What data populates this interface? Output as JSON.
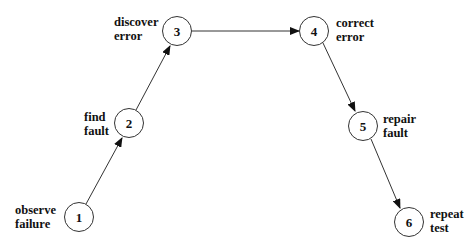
{
  "diagram": {
    "type": "process-flow",
    "nodes": [
      {
        "id": "1",
        "number": "1",
        "label_line1": "observe",
        "label_line2": "failure"
      },
      {
        "id": "2",
        "number": "2",
        "label_line1": "find",
        "label_line2": "fault"
      },
      {
        "id": "3",
        "number": "3",
        "label_line1": "discover",
        "label_line2": "error"
      },
      {
        "id": "4",
        "number": "4",
        "label_line1": "correct",
        "label_line2": "error"
      },
      {
        "id": "5",
        "number": "5",
        "label_line1": "repair",
        "label_line2": "fault"
      },
      {
        "id": "6",
        "number": "6",
        "label_line1": "repeat",
        "label_line2": "test"
      }
    ],
    "edges": [
      {
        "from": "1",
        "to": "2"
      },
      {
        "from": "2",
        "to": "3"
      },
      {
        "from": "3",
        "to": "4"
      },
      {
        "from": "4",
        "to": "5"
      },
      {
        "from": "5",
        "to": "6"
      }
    ]
  }
}
